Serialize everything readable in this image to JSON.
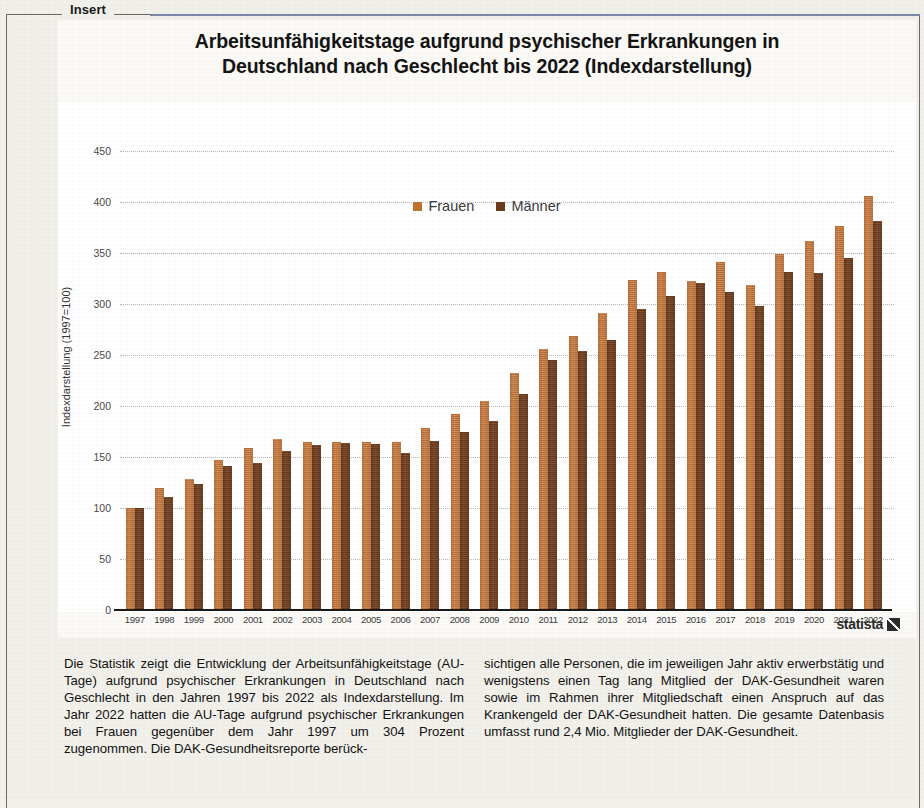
{
  "frame": {
    "legend_label": "Insert"
  },
  "chart": {
    "title_line1": "Arbeitsunfähigkeitstage aufgrund psychischer Erkrankungen in",
    "title_line2": "Deutschland nach Geschlecht bis 2022 (Indexdarstellung)",
    "source_word": "statista",
    "source_mark": "statista-logo-icon",
    "colors": {
      "frauen": "#c0722f",
      "maenner": "#6d3b1c"
    }
  },
  "chart_data": {
    "type": "bar",
    "title": "Arbeitsunfähigkeitstage aufgrund psychischer Erkrankungen in Deutschland nach Geschlecht bis 2022 (Indexdarstellung)",
    "xlabel": "",
    "ylabel": "Indexdarstellung (1997=100)",
    "ylim": [
      0,
      450
    ],
    "yticks": [
      0,
      50,
      100,
      150,
      200,
      250,
      300,
      350,
      400,
      450
    ],
    "grid": true,
    "legend_position": "top-center",
    "categories": [
      "1997",
      "1998",
      "1999",
      "2000",
      "2001",
      "2002",
      "2003",
      "2004",
      "2005",
      "2006",
      "2007",
      "2008",
      "2009",
      "2010",
      "2011",
      "2012",
      "2013",
      "2014",
      "2015",
      "2016",
      "2017",
      "2018",
      "2019",
      "2020",
      "2021",
      "2022"
    ],
    "series": [
      {
        "name": "Frauen",
        "color": "#c0722f",
        "values": [
          100,
          120,
          128,
          147,
          159,
          168,
          165,
          165,
          165,
          165,
          178,
          192,
          205,
          232,
          256,
          269,
          291,
          324,
          331,
          323,
          341,
          319,
          349,
          362,
          376,
          406
        ]
      },
      {
        "name": "Männer",
        "color": "#6d3b1c",
        "values": [
          100,
          111,
          124,
          141,
          144,
          156,
          162,
          164,
          163,
          154,
          166,
          175,
          185,
          212,
          245,
          254,
          265,
          295,
          308,
          321,
          312,
          298,
          331,
          330,
          345,
          381
        ]
      }
    ]
  },
  "body": {
    "left": "Die Statistik zeigt die Entwicklung der Arbeitsunfähigkeitstage (AU-Tage) aufgrund psychischer Erkrankungen in Deutschland nach Geschlecht in den Jahren 1997 bis 2022 als Indexdarstellung. Im Jahr 2022 hatten die AU-Tage aufgrund psychischer Erkrankungen bei Frauen gegenüber dem Jahr 1997 um 304 Prozent zugenommen. Die DAK-Gesundheitsreporte berück-",
    "right": "sichtigen alle Personen, die im jeweiligen Jahr aktiv erwerbstätig und wenigstens einen Tag lang Mitglied der DAK-Gesundheit waren sowie im Rahmen ihrer Mitgliedschaft einen Anspruch auf das Krankengeld der DAK-Gesundheit hatten. Die gesamte Datenbasis umfasst rund 2,4 Mio. Mitglieder der DAK-Gesundheit."
  }
}
